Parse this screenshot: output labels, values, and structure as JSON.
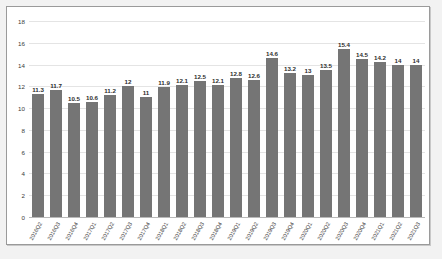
{
  "chart_data": {
    "type": "bar",
    "title": "",
    "xlabel": "",
    "ylabel": "",
    "ylim": [
      0,
      18
    ],
    "yticks": [
      0,
      2,
      4,
      6,
      8,
      10,
      12,
      14,
      16,
      18
    ],
    "grid": true,
    "legend": "none",
    "bar_color": "#757575",
    "categories": [
      "2016Q2",
      "2016Q3",
      "2016Q4",
      "2017Q1",
      "2017Q2",
      "2017Q3",
      "2017Q4",
      "2018Q1",
      "2018Q2",
      "2018Q3",
      "2018Q4",
      "2019Q1",
      "2019Q2",
      "2019Q3",
      "2019Q4",
      "2020Q1",
      "2020Q2",
      "2020Q3",
      "2020Q4",
      "2021Q1",
      "2021Q2",
      "2021Q3"
    ],
    "values": [
      11.3,
      11.7,
      10.5,
      10.6,
      11.2,
      12,
      11,
      11.9,
      12.1,
      12.5,
      12.1,
      12.8,
      12.6,
      14.6,
      13.2,
      13,
      13.5,
      15.4,
      14.5,
      14.2,
      14,
      14
    ],
    "data_labels": [
      "11.3",
      "11.7",
      "10.5",
      "10.6",
      "11.2",
      "12",
      "11",
      "11.9",
      "12.1",
      "12.5",
      "12.1",
      "12.8",
      "12.6",
      "14.6",
      "13.2",
      "13",
      "13.5",
      "15.4",
      "14.5",
      "14.2",
      "14",
      "14"
    ]
  }
}
